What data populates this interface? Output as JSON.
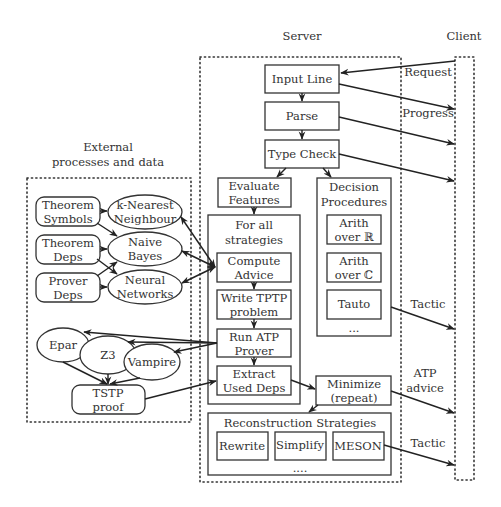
{
  "regions": {
    "external": {
      "title_line1": "External",
      "title_line2": "processes and data"
    },
    "server": {
      "title": "Server"
    },
    "client": {
      "title": "Client"
    }
  },
  "server_nodes": {
    "input_line": "Input Line",
    "parse": "Parse",
    "type_check": "Type Check",
    "evaluate_features": {
      "line1": "Evaluate",
      "line2": "Features"
    },
    "for_all_strategies": {
      "line1": "For all",
      "line2": "strategies"
    },
    "compute_advice": {
      "line1": "Compute",
      "line2": "Advice"
    },
    "write_tptp": {
      "line1": "Write TPTP",
      "line2": "problem"
    },
    "run_atp": {
      "line1": "Run ATP",
      "line2": "Prover"
    },
    "extract_deps": {
      "line1": "Extract",
      "line2": "Used Deps"
    },
    "decision_procedures": {
      "line1": "Decision",
      "line2": "Procedures"
    },
    "arith_r": {
      "line1": "Arith",
      "line2": "over ℝ"
    },
    "arith_c": {
      "line1": "Arith",
      "line2": "over ℂ"
    },
    "tauto": "Tauto",
    "decision_more": "...",
    "minimize": {
      "line1": "Minimize",
      "line2": "(repeat)"
    },
    "reconstruction": "Reconstruction Strategies",
    "rewrite": "Rewrite",
    "simplify": "Simplify",
    "meson": "MESON",
    "reconstruction_more": "...."
  },
  "external_nodes": {
    "theorem_symbols": {
      "line1": "Theorem",
      "line2": "Symbols"
    },
    "theorem_deps": {
      "line1": "Theorem",
      "line2": "Deps"
    },
    "prover_deps": {
      "line1": "Prover",
      "line2": "Deps"
    },
    "knn": {
      "line1": "k-Nearest",
      "line2": "Neighbour"
    },
    "naive_bayes": {
      "line1": "Naive",
      "line2": "Bayes"
    },
    "neural_networks": {
      "line1": "Neural",
      "line2": "Networks"
    },
    "epar": "Epar",
    "z3": "Z3",
    "vampire": "Vampire",
    "tstp_proof": {
      "line1": "TSTP",
      "line2": "proof"
    }
  },
  "edge_labels": {
    "request": "Request",
    "progress": "Progress",
    "tactic_1": "Tactic",
    "atp_advice_line1": "ATP",
    "atp_advice_line2": "advice",
    "tactic_2": "Tactic"
  }
}
